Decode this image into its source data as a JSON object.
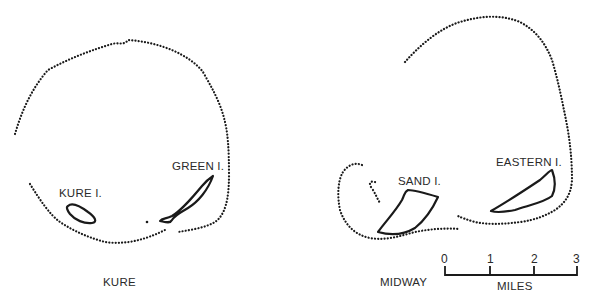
{
  "maps": [
    {
      "name": "KURE",
      "islands": [
        "KURE I.",
        "GREEN I."
      ]
    },
    {
      "name": "MIDWAY",
      "islands": [
        "SAND I.",
        "EASTERN I."
      ]
    }
  ],
  "scale_bar": {
    "unit_label": "MILES",
    "ticks": [
      "0",
      "1",
      "2",
      "3"
    ]
  }
}
